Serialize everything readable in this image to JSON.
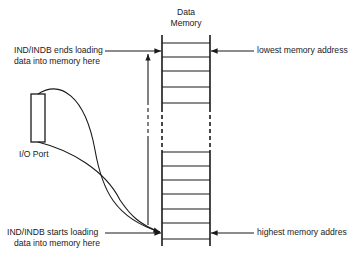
{
  "title": {
    "line1": "Data",
    "line2": "Memory"
  },
  "labels": {
    "ends_line1": "IND/INDB ends loading",
    "ends_line2": "data into memory here",
    "starts_line1": "IND/INDB starts loading",
    "starts_line2": "data into memory here",
    "lowest": "lowest memory address",
    "highest": "highest memory addres",
    "io_port": "I/O Port"
  },
  "colors": {
    "ink": "#1a1a1a",
    "background": "#ffffff"
  }
}
